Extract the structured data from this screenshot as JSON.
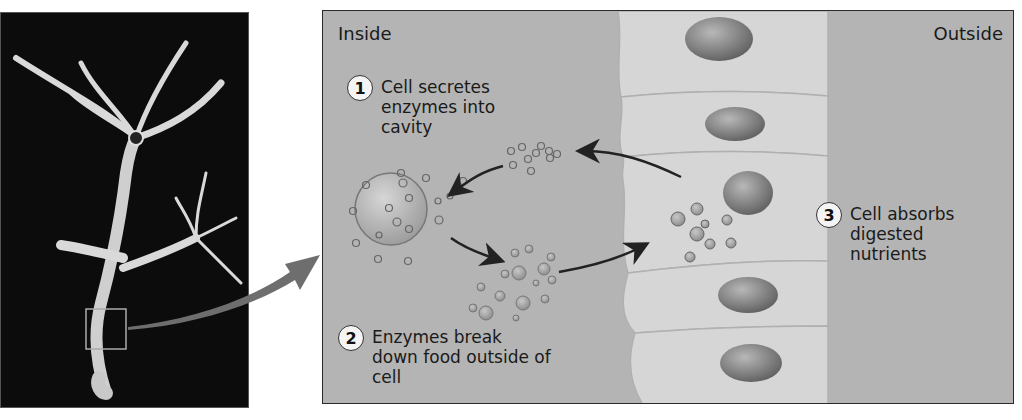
{
  "figure": {
    "photo": {
      "subject": "Hydra specimen on black background",
      "highlight": "zoom-box on lower body column"
    },
    "panel": {
      "inside_label": "Inside",
      "outside_label": "Outside",
      "steps": [
        {
          "number": "1",
          "text_lines": [
            "Cell secretes",
            "enzymes into",
            "cavity"
          ]
        },
        {
          "number": "2",
          "text_lines": [
            "Enzymes break",
            "down food outside of",
            "cell"
          ]
        },
        {
          "number": "3",
          "text_lines": [
            "Cell absorbs",
            "digested",
            "nutrients"
          ]
        }
      ]
    },
    "colors": {
      "panel_bg": "#b4b4b4",
      "cell_fill": "#d8d8d8",
      "nucleus": "#7a7a7a",
      "photo_bg": "#0c0c0c",
      "arrow": "#2b2b2b"
    }
  }
}
